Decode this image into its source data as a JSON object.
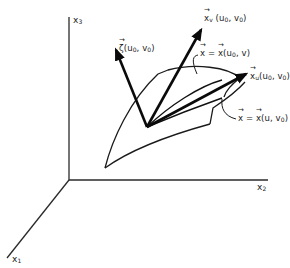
{
  "figure": {
    "axes": {
      "x1": {
        "name": "x",
        "sub": "1"
      },
      "x2": {
        "name": "x",
        "sub": "2"
      },
      "x3": {
        "name": "x",
        "sub": "3"
      }
    },
    "labels": {
      "zeta": {
        "sym": "ζ",
        "args": "(u",
        "arg_sub1": "0",
        "mid": ", v",
        "arg_sub2": "0",
        "close": ")"
      },
      "xv": {
        "sym": "x",
        "sub": "v",
        "args": " (u",
        "arg_sub1": "0",
        "mid": ", v",
        "arg_sub2": "0",
        "close": ")"
      },
      "xu": {
        "sym": "x",
        "sub": "u",
        "args": "(u",
        "arg_sub1": "0",
        "mid": ", v",
        "arg_sub2": "0",
        "close": ")"
      },
      "curve_v": {
        "lhs": "x",
        "eq": " = ",
        "rhs": "x",
        "args": "(u",
        "arg_sub1": "0",
        "rest": ", v)"
      },
      "curve_u": {
        "lhs": "x",
        "eq": " = ",
        "rhs": "x",
        "args": "(u, v",
        "arg_sub1": "0",
        "rest": ")"
      }
    },
    "colors": {
      "ink": "#1a1a1a",
      "background": "#ffffff"
    }
  }
}
